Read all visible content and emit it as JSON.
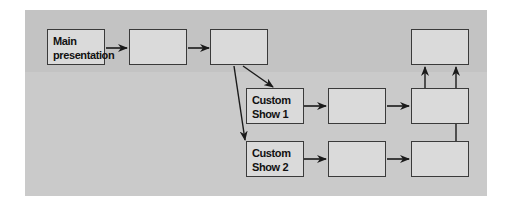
{
  "diagram": {
    "type": "flowchart",
    "title": "",
    "colors": {
      "panel_top": "#c3c3c3",
      "panel_bottom": "#cacaca",
      "box_fill": "#dadada",
      "box_border": "#3a3a3a",
      "arrow": "#1a1a1a"
    },
    "nodes": [
      {
        "id": "main",
        "label": "Main presentation",
        "lines": [
          "Main",
          "presentation"
        ]
      },
      {
        "id": "main-2",
        "label": ""
      },
      {
        "id": "main-3",
        "label": ""
      },
      {
        "id": "main-end",
        "label": ""
      },
      {
        "id": "cs1",
        "label": "Custom Show 1",
        "lines": [
          "Custom",
          "Show 1"
        ]
      },
      {
        "id": "cs1-2",
        "label": ""
      },
      {
        "id": "cs1-3",
        "label": ""
      },
      {
        "id": "cs2",
        "label": "Custom Show 2",
        "lines": [
          "Custom",
          "Show 2"
        ]
      },
      {
        "id": "cs2-2",
        "label": ""
      },
      {
        "id": "cs2-3",
        "label": ""
      }
    ],
    "edges": [
      {
        "from": "main",
        "to": "main-2"
      },
      {
        "from": "main-2",
        "to": "main-3"
      },
      {
        "from": "main-3",
        "to": "cs1"
      },
      {
        "from": "main-3",
        "to": "cs2"
      },
      {
        "from": "cs1",
        "to": "cs1-2"
      },
      {
        "from": "cs1-2",
        "to": "cs1-3"
      },
      {
        "from": "cs1-3",
        "to": "main-end"
      },
      {
        "from": "cs2",
        "to": "cs2-2"
      },
      {
        "from": "cs2-2",
        "to": "cs2-3"
      },
      {
        "from": "cs2-3",
        "to": "main-end"
      }
    ]
  }
}
